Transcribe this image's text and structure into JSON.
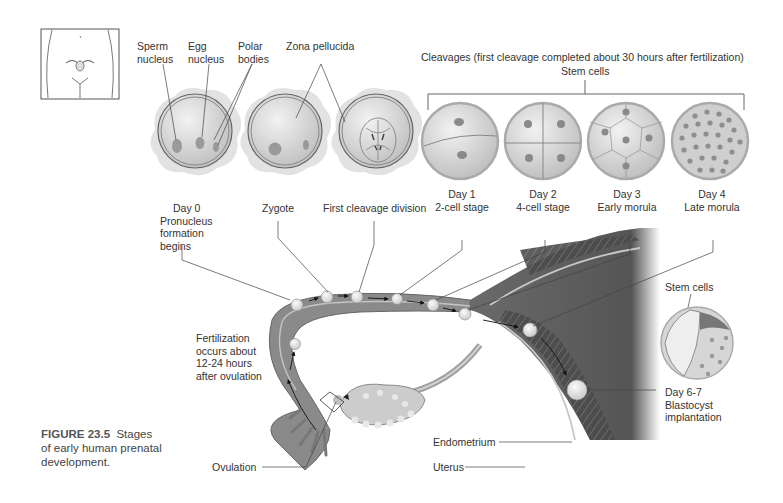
{
  "figure": {
    "number": "FIGURE 23.5",
    "caption_line1": "Stages",
    "caption_line2": "of early human prenatal",
    "caption_line3": "development."
  },
  "top_labels": {
    "sperm_nucleus": [
      "Sperm",
      "nucleus"
    ],
    "egg_nucleus": [
      "Egg",
      "nucleus"
    ],
    "polar_bodies": [
      "Polar",
      "bodies"
    ],
    "zona_pellucida": "Zona pellucida",
    "cleavages": "Cleavages (first cleavage completed about 30 hours after fertilization)",
    "stem_cells_top": "Stem cells"
  },
  "stages": [
    {
      "lines": [
        "Day 0",
        "Pronucleus",
        "formation",
        "begins"
      ]
    },
    {
      "lines": [
        "Zygote"
      ]
    },
    {
      "lines": [
        "First cleavage division"
      ]
    },
    {
      "lines": [
        "Day 1",
        "2-cell stage"
      ]
    },
    {
      "lines": [
        "Day 2",
        "4-cell stage"
      ]
    },
    {
      "lines": [
        "Day 3",
        "Early morula"
      ]
    },
    {
      "lines": [
        "Day 4",
        "Late morula"
      ]
    }
  ],
  "side_labels": {
    "fertilization": [
      "Fertilization",
      "occurs about",
      "12-24 hours",
      "after ovulation"
    ],
    "stem_cells_blast": "Stem cells",
    "blastocyst": [
      "Day 6-7",
      "Blastocyst",
      "implantation"
    ],
    "endometrium": "Endometrium",
    "uterus": "Uterus",
    "ovulation": "Ovulation"
  },
  "colors": {
    "tissue_dark": "#5a5a5a",
    "tissue_mid": "#8a8a8a",
    "cell_fill": "#d8d8d8",
    "line": "#444444"
  }
}
